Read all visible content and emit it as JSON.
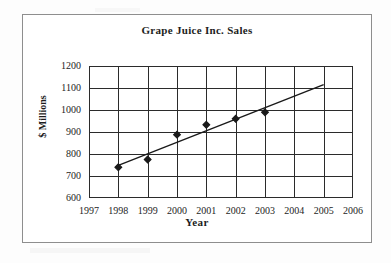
{
  "chart_data": {
    "type": "scatter",
    "title": "Grape Juice Inc. Sales",
    "xlabel": "Year",
    "ylabel": "$ Millions",
    "xlim": [
      1997,
      2006
    ],
    "ylim": [
      600,
      1200
    ],
    "xticks": [
      "1997",
      "1998",
      "1999",
      "2000",
      "2001",
      "2002",
      "2003",
      "2004",
      "2005",
      "2006"
    ],
    "yticks": [
      "600",
      "700",
      "800",
      "900",
      "1000",
      "1100",
      "1200"
    ],
    "grid": true,
    "legend": null,
    "marker": "diamond",
    "marker_color": "#1a1a1a",
    "line_color": "#1a1a1a",
    "series": [
      {
        "name": "Sales",
        "x": [
          1998,
          1999,
          2000,
          2001,
          2002,
          2003
        ],
        "values": [
          740,
          775,
          888,
          933,
          960,
          990
        ]
      }
    ],
    "trendline": {
      "name": "Linear trendline",
      "x": [
        1998,
        2005
      ],
      "values": [
        748,
        1115
      ]
    }
  },
  "frame": {
    "border_color": "#8e8e8e",
    "background": "#ffffff"
  }
}
